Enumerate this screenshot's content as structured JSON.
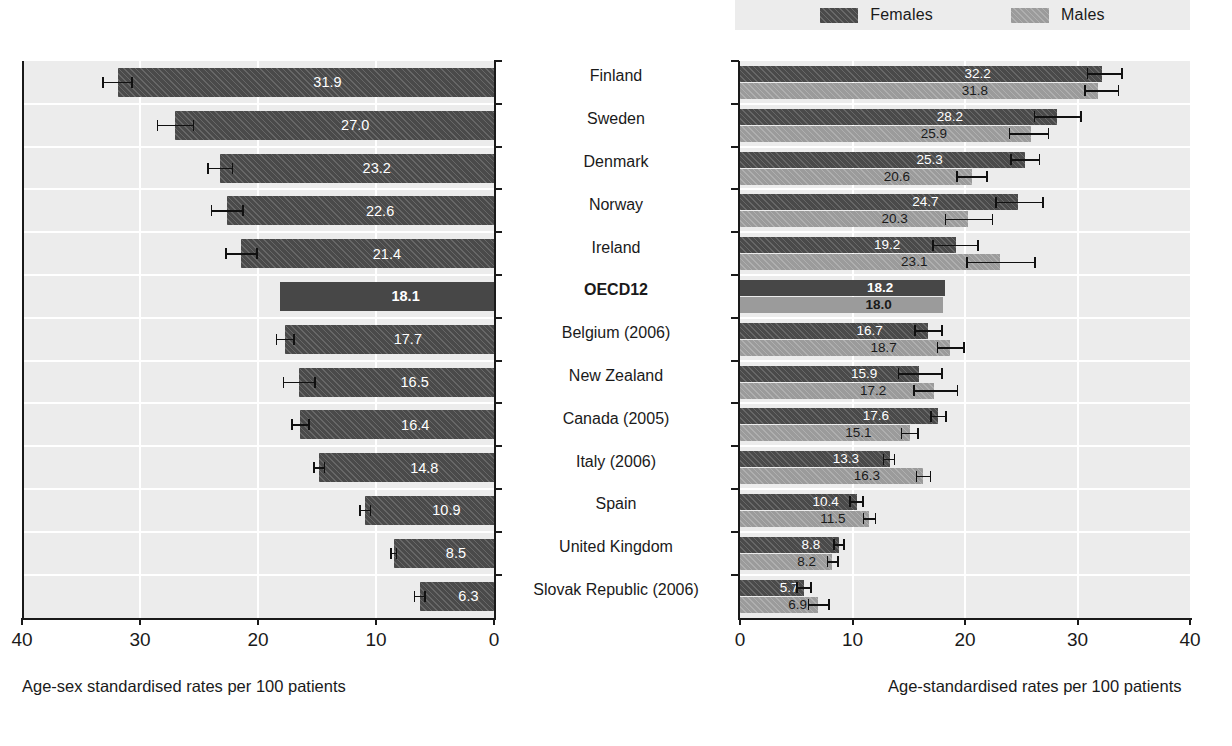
{
  "legend": {
    "items": [
      {
        "label": "Females",
        "swatch": "female-swatch",
        "color": "#4a4a4a"
      },
      {
        "label": "Males",
        "swatch": "male-swatch",
        "color": "#9b9b9b"
      }
    ]
  },
  "title_fragment": "",
  "countries": [
    "Finland",
    "Sweden",
    "Denmark",
    "Norway",
    "Ireland",
    "OECD12",
    "Belgium (2006)",
    "New Zealand",
    "Canada (2005)",
    "Italy (2006)",
    "Spain",
    "United Kingdom",
    "Slovak Republic (2006)"
  ],
  "left_axis": {
    "ticks": [
      "40",
      "30",
      "20",
      "10",
      "0"
    ],
    "title": "Age-sex standardised rates per 100 patients"
  },
  "right_axis": {
    "ticks": [
      "0",
      "10",
      "20",
      "30",
      "40"
    ],
    "title": "Age-standardised rates per 100 patients"
  },
  "chart_data": [
    {
      "type": "bar",
      "id": "left-panel-total",
      "title": "",
      "orientation": "horizontal",
      "direction": "right-to-left",
      "xlabel": "Age-sex standardised rates per 100 patients",
      "ylabel": "",
      "xlim": [
        0,
        40
      ],
      "xticks": [
        40,
        30,
        20,
        10,
        0
      ],
      "grid": true,
      "categories": [
        "Finland",
        "Sweden",
        "Denmark",
        "Norway",
        "Ireland",
        "OECD12",
        "Belgium (2006)",
        "New Zealand",
        "Canada (2005)",
        "Italy (2006)",
        "Spain",
        "United Kingdom",
        "Slovak Republic (2006)"
      ],
      "values": [
        31.9,
        27.0,
        23.2,
        22.6,
        21.4,
        18.1,
        17.7,
        16.5,
        16.4,
        14.8,
        10.9,
        8.5,
        6.3
      ],
      "value_labels": [
        "31.9",
        "27.0",
        "23.2",
        "22.6",
        "21.4",
        "18.1",
        "17.7",
        "16.5",
        "16.4",
        "14.8",
        "10.9",
        "8.5",
        "6.3"
      ],
      "error_bars": [
        {
          "low": 30.6,
          "high": 33.2
        },
        {
          "low": 25.4,
          "high": 28.6
        },
        {
          "low": 22.1,
          "high": 24.3
        },
        {
          "low": 21.2,
          "high": 24.0
        },
        {
          "low": 20.0,
          "high": 22.8
        },
        null,
        {
          "low": 16.9,
          "high": 18.5
        },
        {
          "low": 15.1,
          "high": 17.9
        },
        {
          "low": 15.6,
          "high": 17.2
        },
        {
          "low": 14.3,
          "high": 15.3
        },
        {
          "low": 10.4,
          "high": 11.4
        },
        {
          "low": 8.2,
          "high": 8.8
        },
        {
          "low": 5.8,
          "high": 6.8
        }
      ],
      "highlight_category": "OECD12"
    },
    {
      "type": "bar",
      "id": "right-panel-by-sex",
      "title": "",
      "orientation": "horizontal",
      "direction": "left-to-right",
      "xlabel": "Age-standardised rates per 100 patients",
      "ylabel": "",
      "xlim": [
        0,
        40
      ],
      "xticks": [
        0,
        10,
        20,
        30,
        40
      ],
      "grid": true,
      "legend_position": "top",
      "categories": [
        "Finland",
        "Sweden",
        "Denmark",
        "Norway",
        "Ireland",
        "OECD12",
        "Belgium (2006)",
        "New Zealand",
        "Canada (2005)",
        "Italy (2006)",
        "Spain",
        "United Kingdom",
        "Slovak Republic (2006)"
      ],
      "series": [
        {
          "name": "Females",
          "color": "#4a4a4a",
          "values": [
            32.2,
            28.2,
            25.3,
            24.7,
            19.2,
            18.2,
            16.7,
            15.9,
            17.6,
            13.3,
            10.4,
            8.8,
            5.7
          ],
          "value_labels": [
            "32.2",
            "28.2",
            "25.3",
            "24.7",
            "19.2",
            "18.2",
            "16.7",
            "15.9",
            "17.6",
            "13.3",
            "10.4",
            "8.8",
            "5.7"
          ],
          "error_bars": [
            {
              "low": 30.8,
              "high": 34.0
            },
            {
              "low": 26.1,
              "high": 30.4
            },
            {
              "low": 24.0,
              "high": 26.7
            },
            {
              "low": 22.7,
              "high": 27.0
            },
            {
              "low": 17.1,
              "high": 21.2
            },
            null,
            {
              "low": 15.5,
              "high": 18.0
            },
            {
              "low": 14.0,
              "high": 18.0
            },
            {
              "low": 16.9,
              "high": 18.4
            },
            {
              "low": 12.7,
              "high": 13.8
            },
            {
              "low": 9.7,
              "high": 11.0
            },
            {
              "low": 8.3,
              "high": 9.3
            },
            {
              "low": 5.0,
              "high": 6.4
            }
          ]
        },
        {
          "name": "Males",
          "color": "#9b9b9b",
          "values": [
            31.8,
            25.9,
            20.6,
            20.3,
            23.1,
            18.0,
            18.7,
            17.2,
            15.1,
            16.3,
            11.5,
            8.2,
            6.9
          ],
          "value_labels": [
            "31.8",
            "25.9",
            "20.6",
            "20.3",
            "23.1",
            "18.0",
            "18.7",
            "17.2",
            "15.1",
            "16.3",
            "11.5",
            "8.2",
            "6.9"
          ],
          "error_bars": [
            {
              "low": 30.6,
              "high": 33.7
            },
            {
              "low": 23.9,
              "high": 27.5
            },
            {
              "low": 19.2,
              "high": 22.0
            },
            {
              "low": 18.2,
              "high": 22.5
            },
            {
              "low": 20.1,
              "high": 26.3
            },
            null,
            {
              "low": 17.5,
              "high": 20.0
            },
            {
              "low": 15.4,
              "high": 19.4
            },
            {
              "low": 14.3,
              "high": 15.9
            },
            {
              "low": 15.6,
              "high": 17.0
            },
            {
              "low": 10.9,
              "high": 12.1
            },
            {
              "low": 7.7,
              "high": 8.8
            },
            {
              "low": 6.0,
              "high": 8.0
            }
          ]
        }
      ],
      "highlight_category": "OECD12"
    }
  ]
}
